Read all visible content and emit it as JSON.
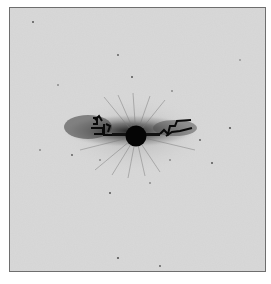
{
  "image": {
    "kind": "grayscale scientific image",
    "description": "Central dark circular core with elongated horizontal halo and jet-like dark filaments on a light noisy gray background",
    "colors": {
      "page_background": "#ffffff",
      "field_background": "#d9d9d9",
      "frame": "#6e6e6e",
      "halo": "#7a7a7a",
      "core": "#050505"
    },
    "frame": {
      "x": 9,
      "y": 7,
      "width": 257,
      "height": 265
    },
    "core": {
      "cx": 136,
      "cy": 136,
      "r": 10
    },
    "halo": {
      "cx": 132,
      "cy": 131,
      "rx": 68,
      "ry": 17
    }
  }
}
